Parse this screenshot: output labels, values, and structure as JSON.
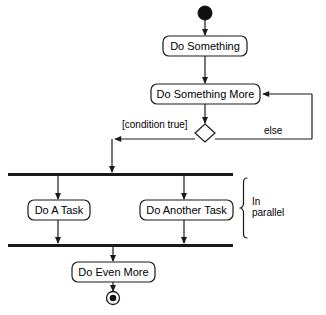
{
  "diagram": {
    "type": "uml-activity-diagram",
    "background_color": "#ffffff",
    "stroke_color": "#1a1a1a",
    "fill_color": "#ffffff",
    "nodes": {
      "initial": {
        "kind": "initial-node",
        "label": ""
      },
      "activity_1": {
        "kind": "activity",
        "label": "Do Something"
      },
      "activity_2": {
        "kind": "activity",
        "label": "Do Something More"
      },
      "decision": {
        "kind": "decision-node",
        "label": ""
      },
      "fork": {
        "kind": "fork-bar",
        "label": ""
      },
      "task_a": {
        "kind": "activity",
        "label": "Do A Task"
      },
      "task_b": {
        "kind": "activity",
        "label": "Do Another Task"
      },
      "join": {
        "kind": "join-bar",
        "label": ""
      },
      "activity_3": {
        "kind": "activity",
        "label": "Do Even More"
      },
      "final": {
        "kind": "final-node",
        "label": ""
      }
    },
    "edge_labels": {
      "condition_true": "[condition true]",
      "else": "else"
    },
    "annotations": {
      "parallel_note_line1": "In",
      "parallel_note_line2": "parallel"
    }
  }
}
